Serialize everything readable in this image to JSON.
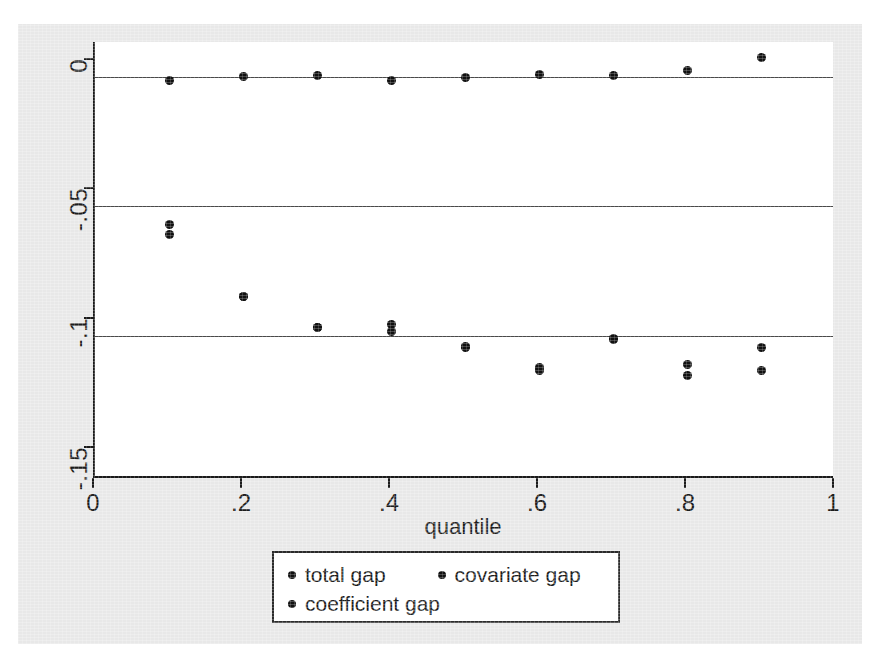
{
  "chart_data": {
    "type": "scatter",
    "title": "",
    "xlabel": "quantile",
    "ylabel": "",
    "xlim": [
      0,
      1
    ],
    "ylim": [
      -0.155,
      0.0135
    ],
    "grid": true,
    "gridlines_y": [
      0,
      -0.05,
      -0.1
    ],
    "xticks": [
      0,
      0.2,
      0.4,
      0.6,
      0.8,
      1
    ],
    "xticklabels": [
      "0",
      ".2",
      ".4",
      ".6",
      ".8",
      "1"
    ],
    "yticks": [
      0,
      -0.05,
      -0.1,
      -0.15
    ],
    "yticklabels": [
      "0",
      "-.05",
      "-.1",
      "-.15"
    ],
    "legend_position": "below-center",
    "x": [
      0.1,
      0.2,
      0.3,
      0.4,
      0.5,
      0.6,
      0.7,
      0.8,
      0.9
    ],
    "series": [
      {
        "name": "total gap",
        "marker": "circle",
        "color": "#111111",
        "values": [
          -0.0012,
          0.0002,
          0.0004,
          -0.0012,
          -0.0003,
          0.0009,
          0.0005,
          0.0026,
          0.0076
        ]
      },
      {
        "name": "covariate gap",
        "marker": "circle",
        "color": "#111111",
        "values": [
          -0.0572,
          -0.0849,
          -0.0968,
          -0.0955,
          -0.1042,
          -0.1124,
          -0.1009,
          -0.111,
          -0.1045
        ]
      },
      {
        "name": "coefficient gap",
        "marker": "circle",
        "color": "#111111",
        "values": [
          -0.0608,
          -0.0849,
          -0.0968,
          -0.0985,
          -0.1046,
          -0.1133,
          -0.1014,
          -0.1152,
          -0.1133
        ]
      }
    ]
  },
  "legend": {
    "entries": [
      {
        "label": "total gap"
      },
      {
        "label": "covariate gap"
      },
      {
        "label": "coefficient gap"
      }
    ]
  },
  "colors": {
    "marker": "#111111",
    "axis": "#1a1a1a",
    "grid": "#4a4a4a",
    "panel_background": "#e8e8e8",
    "plot_background": "#ffffff"
  }
}
